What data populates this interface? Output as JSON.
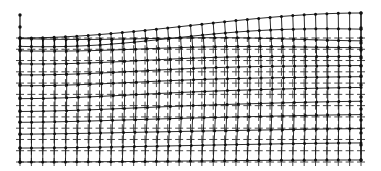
{
  "diagram": {
    "type": "deformed-mesh",
    "colors": {
      "background": "#ffffff",
      "mesh": "#111111",
      "reference": "#444444"
    },
    "grid": {
      "columns": 31,
      "x_left": 20,
      "x_right": 361,
      "reference_top_y": 38,
      "bottom_y": 162,
      "reference_rows": 11
    },
    "left_edge_nodes_y": [
      15,
      27,
      38,
      50,
      63,
      74,
      85,
      98,
      111,
      122,
      134,
      148,
      162
    ],
    "right_edge_nodes_y": [
      13,
      28,
      38,
      43,
      50,
      58,
      66,
      76,
      85,
      97,
      109,
      120,
      133,
      145,
      160
    ]
  }
}
